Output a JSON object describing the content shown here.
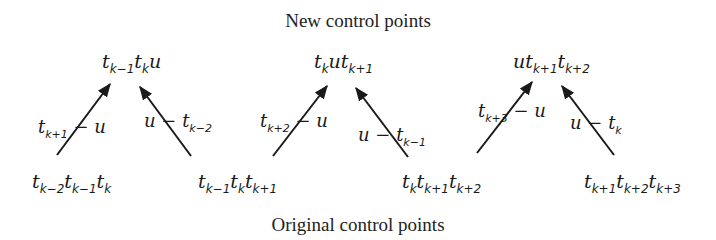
{
  "titles": {
    "top": "New control points",
    "bottom": "Original control points"
  },
  "new_points": [
    {
      "parts": [
        [
          "t",
          "k−1"
        ],
        [
          "t",
          "k"
        ],
        [
          "u",
          ""
        ]
      ]
    },
    {
      "parts": [
        [
          "t",
          "k"
        ],
        [
          "u",
          ""
        ],
        [
          "t",
          "k+1"
        ]
      ]
    },
    {
      "parts": [
        [
          "u",
          ""
        ],
        [
          "t",
          "k+1"
        ],
        [
          "t",
          "k+2"
        ]
      ]
    }
  ],
  "original_points": [
    {
      "parts": [
        [
          "t",
          "k−2"
        ],
        [
          "t",
          "k−1"
        ],
        [
          "t",
          "k"
        ]
      ]
    },
    {
      "parts": [
        [
          "t",
          "k−1"
        ],
        [
          "t",
          "k"
        ],
        [
          "t",
          "k+1"
        ]
      ]
    },
    {
      "parts": [
        [
          "t",
          "k"
        ],
        [
          "t",
          "k+1"
        ],
        [
          "t",
          "k+2"
        ]
      ]
    },
    {
      "parts": [
        [
          "t",
          "k+1"
        ],
        [
          "t",
          "k+2"
        ],
        [
          "t",
          "k+3"
        ]
      ]
    }
  ],
  "weights": [
    {
      "text": "t_{k+1} − u",
      "parts": [
        [
          "t",
          "k+1"
        ],
        [
          " − u",
          ""
        ]
      ]
    },
    {
      "text": "u − t_{k−2}",
      "parts": [
        [
          "u − ",
          ""
        ],
        [
          "t",
          "k−2"
        ]
      ]
    },
    {
      "text": "t_{k+2} − u",
      "parts": [
        [
          "t",
          "k+2"
        ],
        [
          " − u",
          ""
        ]
      ]
    },
    {
      "text": "u − t_{k−1}",
      "parts": [
        [
          "u − ",
          ""
        ],
        [
          "t",
          "k−1"
        ]
      ]
    },
    {
      "text": "t_{k+3} − u",
      "parts": [
        [
          "t",
          "k+3"
        ],
        [
          " − u",
          ""
        ]
      ]
    },
    {
      "text": "u − t_k",
      "parts": [
        [
          "u − ",
          ""
        ],
        [
          "t",
          "k"
        ]
      ]
    }
  ],
  "arrows": [
    {
      "from": [
        57,
        155
      ],
      "to": [
        110,
        84
      ]
    },
    {
      "from": [
        191,
        156
      ],
      "to": [
        140,
        87
      ]
    },
    {
      "from": [
        273,
        156
      ],
      "to": [
        327,
        86
      ]
    },
    {
      "from": [
        408,
        157
      ],
      "to": [
        356,
        88
      ]
    },
    {
      "from": [
        477,
        153
      ],
      "to": [
        532,
        82
      ]
    },
    {
      "from": [
        614,
        155
      ],
      "to": [
        562,
        86
      ]
    }
  ],
  "colors": {
    "ink": "#1a1a1a",
    "background": "#ffffff"
  }
}
